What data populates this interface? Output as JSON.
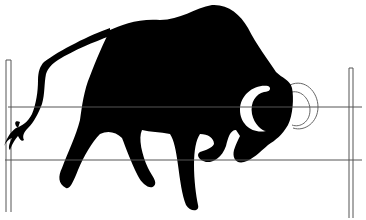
{
  "image": {
    "subject": "Black silhouette of a charging bull with head lowered, horn curling forward, tail raised, in front of a fence",
    "alt_text": "Bull silhouette behind a wire fence",
    "colors": {
      "background": "#ffffff",
      "silhouette": "#000000",
      "fence_line": "#555555",
      "horn_outline": "#666666"
    },
    "elements": {
      "bull": "bull-silhouette",
      "horn": "horn-crescent",
      "horn_outline": "horn-outline-arcs",
      "tail": "tail",
      "fence_posts": [
        "left-fence-post",
        "right-fence-post"
      ],
      "fence_wires": [
        "upper-fence-wire",
        "lower-fence-wire"
      ]
    }
  }
}
